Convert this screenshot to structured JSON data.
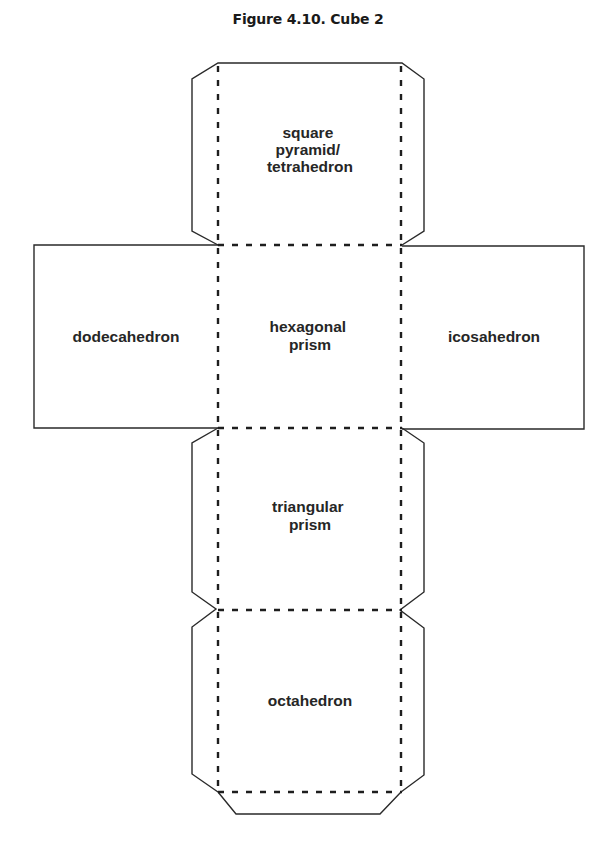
{
  "figure": {
    "title": "Figure 4.10. Cube 2",
    "type": "cube net (cut-out template)",
    "legend": {
      "solid_line": "cut line",
      "dashed_line": "fold line"
    }
  },
  "faces": {
    "top": {
      "label_lines": [
        "square",
        "pyramid/",
        "tetrahedron"
      ]
    },
    "left": {
      "label_lines": [
        "dodecahedron"
      ]
    },
    "center": {
      "label_lines": [
        "hexagonal",
        "prism"
      ]
    },
    "right": {
      "label_lines": [
        "icosahedron"
      ]
    },
    "lower_middle": {
      "label_lines": [
        "triangular",
        "prism"
      ]
    },
    "bottom": {
      "label_lines": [
        "octahedron"
      ]
    }
  },
  "colors": {
    "background": "#ffffff",
    "line": "#2a2a2a",
    "text": "#262626"
  }
}
